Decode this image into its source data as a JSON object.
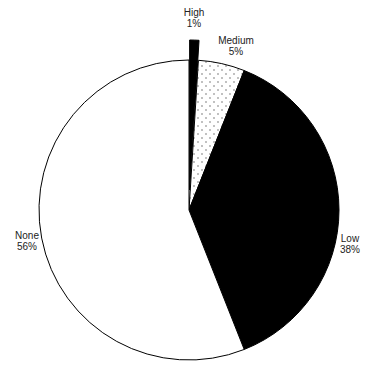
{
  "chart_data": {
    "type": "pie",
    "title": "",
    "categories": [
      "High",
      "Medium",
      "Low",
      "None"
    ],
    "values": [
      1,
      5,
      38,
      56
    ],
    "unit": "%",
    "start_angle_deg_from_top": 0,
    "direction": "clockwise",
    "exploded": [
      "High"
    ],
    "slices": [
      {
        "label": "High",
        "value": 1,
        "value_label": "1%",
        "fill": "black",
        "exploded": true
      },
      {
        "label": "Medium",
        "value": 5,
        "value_label": "5%",
        "fill": "dotted"
      },
      {
        "label": "Low",
        "value": 38,
        "value_label": "38%",
        "fill": "black"
      },
      {
        "label": "None",
        "value": 56,
        "value_label": "56%",
        "fill": "white"
      }
    ],
    "legend": "none",
    "labels_position": "outside"
  },
  "labels": {
    "high": {
      "name": "High",
      "pct": "1%"
    },
    "medium": {
      "name": "Medium",
      "pct": "5%"
    },
    "low": {
      "name": "Low",
      "pct": "38%"
    },
    "none": {
      "name": "None",
      "pct": "56%"
    }
  },
  "colors": {
    "black_slice": "#000000",
    "outline": "#000000",
    "background": "#ffffff",
    "dots": "#555555",
    "text": "#222222"
  }
}
